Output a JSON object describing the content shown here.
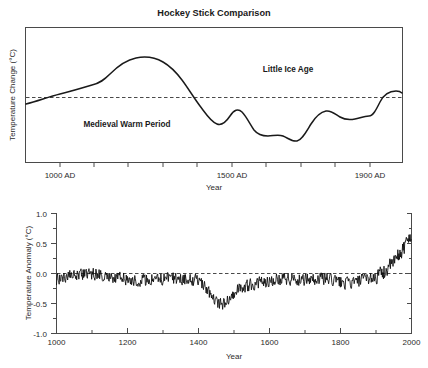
{
  "figure": {
    "title": "Hockey Stick Comparison",
    "background_color": "#ffffff",
    "line_color": "#1a1a1a",
    "axis_color": "#4a4a4a"
  },
  "chart_data": [
    {
      "type": "line",
      "id": "top-panel",
      "title": "Hockey Stick Comparison",
      "xlabel": "Year",
      "ylabel": "Temperature Change (°C)",
      "xlim": [
        900,
        1990
      ],
      "ylim": [
        -1.0,
        1.0
      ],
      "grid": false,
      "legend": "none",
      "xtick_labels": [
        "1000 AD",
        "1500 AD",
        "1900 AD"
      ],
      "xtick_values": [
        1000,
        1500,
        1900
      ],
      "xminor_tick_values": [
        1000,
        1100,
        1200,
        1300,
        1400,
        1500,
        1600,
        1700,
        1800,
        1900
      ],
      "ytick_labels": [],
      "reference_line": {
        "y": 0.0,
        "style": "dashed"
      },
      "annotations": [
        {
          "text": "Medieval Warm Period",
          "x": 1175,
          "y": -0.42
        },
        {
          "text": "Little Ice Age",
          "x": 1600,
          "y": 0.44
        }
      ],
      "series": [
        {
          "name": "Schematic IPCC 1990 curve",
          "x": [
            900,
            950,
            1000,
            1050,
            1100,
            1150,
            1200,
            1250,
            1300,
            1350,
            1400,
            1450,
            1480,
            1500,
            1520,
            1550,
            1580,
            1600,
            1630,
            1650,
            1670,
            1690,
            1710,
            1730,
            1750,
            1780,
            1800,
            1830,
            1860,
            1890,
            1910,
            1930,
            1950,
            1970,
            1990
          ],
          "y": [
            -0.1,
            -0.02,
            0.06,
            0.12,
            0.22,
            0.33,
            0.38,
            0.37,
            0.3,
            0.12,
            -0.05,
            -0.28,
            -0.32,
            -0.18,
            -0.2,
            -0.38,
            -0.5,
            -0.52,
            -0.5,
            -0.52,
            -0.56,
            -0.58,
            -0.4,
            -0.25,
            -0.28,
            -0.32,
            -0.3,
            -0.28,
            -0.3,
            -0.28,
            -0.05,
            0.06,
            0.08,
            0.06,
            0.07
          ]
        }
      ]
    },
    {
      "type": "line",
      "id": "bottom-panel",
      "title": "",
      "xlabel": "Year",
      "ylabel": "Temperature Anomaly (°C)",
      "xlim": [
        1000,
        2000
      ],
      "ylim": [
        -1.0,
        1.0
      ],
      "grid": false,
      "legend": "none",
      "xtick_labels": [
        "1000",
        "1200",
        "1400",
        "1600",
        "1800",
        "2000"
      ],
      "xtick_values": [
        1000,
        1200,
        1400,
        1600,
        1800,
        2000
      ],
      "xminor_tick_values": [
        1100,
        1300,
        1500,
        1700,
        1900
      ],
      "ytick_labels": [
        "1.0",
        "0.5",
        "0.0",
        "-0.5",
        "-1.0"
      ],
      "ytick_values": [
        1.0,
        0.5,
        0.0,
        -0.5,
        -1.0
      ],
      "yminor_tick_values": [
        0.75,
        0.25,
        -0.25,
        -0.75
      ],
      "reference_line": {
        "y": 0.0,
        "style": "dashed"
      },
      "annotations": [],
      "series": [
        {
          "name": "Northern Hemisphere reconstructed temperature anomaly",
          "description": "Annual-resolution noisy reconstruction, slightly below zero for most of the millennium with a sharp 20th-century rise to about +0.6 °C",
          "x_start": 1000,
          "x_end": 2000,
          "baseline_approx": -0.1,
          "noise_amplitude_approx": 0.12,
          "minimum_approx": {
            "year": 1460,
            "value": -0.42
          },
          "maximum_approx": {
            "year": 1998,
            "value": 0.62
          }
        }
      ]
    }
  ]
}
